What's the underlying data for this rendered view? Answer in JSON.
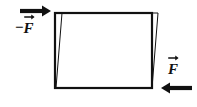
{
  "figure": {
    "type": "physics-force-diagram",
    "background_color": "#ffffff",
    "stroke_color": "#111111",
    "width": 197,
    "height": 107
  },
  "labels": {
    "left": {
      "minus": "−",
      "symbol": "F",
      "vector_accent": "arrow-right",
      "full_text": "−F⃗"
    },
    "right": {
      "minus": "",
      "symbol": "F",
      "vector_accent": "arrow-right",
      "full_text": "F⃗"
    }
  },
  "arrows": {
    "top_left": {
      "direction": "right",
      "x1": 20,
      "y1": 11,
      "x2": 50,
      "y2": 11,
      "color": "#111111"
    },
    "bottom_right": {
      "direction": "left",
      "x1": 192,
      "y1": 88,
      "x2": 160,
      "y2": 88,
      "color": "#111111"
    }
  },
  "shapes": {
    "rectangle": {
      "name": "undeformed-block",
      "left": 55,
      "top": 13,
      "right": 152,
      "bottom": 88,
      "stroke_width": 2.2,
      "fill": "none",
      "stroke": "#111111"
    },
    "parallelogram": {
      "name": "sheared-block",
      "points": "62,13 158,13 152,88 56,88",
      "stroke_width": 1,
      "fill": "none",
      "stroke": "#111111"
    }
  }
}
